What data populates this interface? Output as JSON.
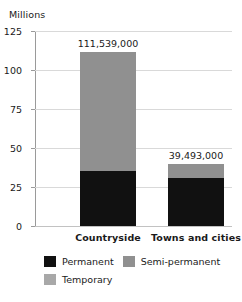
{
  "chart_data": {
    "type": "bar",
    "subtype": "stacked-bar",
    "title": "",
    "xlabel": "",
    "ylabel": "Millions",
    "ylim": [
      0,
      125
    ],
    "yticks": [
      "0",
      "25",
      "50",
      "75",
      "100",
      "125"
    ],
    "ytick_values": [
      0,
      25,
      50,
      75,
      100,
      125
    ],
    "grid": true,
    "legend_position": "bottom",
    "categories": [
      "Countryside",
      "Towns and cities"
    ],
    "series": [
      {
        "name": "Permanent",
        "color": "#111111",
        "values": [
          35.0,
          30.5
        ]
      },
      {
        "name": "Semi-permanent",
        "color": "#909090",
        "values": [
          76.5,
          9.0
        ]
      },
      {
        "name": "Temporary",
        "color": "#a8a8a8",
        "values": [
          0,
          0
        ]
      }
    ],
    "totals": [
      111539000,
      39493000
    ],
    "total_labels": [
      "111,539,000",
      "39,493,000"
    ],
    "annotations": [
      {
        "text": "111,539,000",
        "category": "Countryside"
      },
      {
        "text": "39,493,000",
        "category": "Towns and cities"
      }
    ]
  },
  "axis": {
    "unit_caption": "Millions"
  },
  "legend": {
    "items": [
      {
        "label": "Permanent",
        "color": "#111111"
      },
      {
        "label": "Semi-permanent",
        "color": "#909090"
      },
      {
        "label": "Temporary",
        "color": "#a8a8a8"
      }
    ]
  },
  "colors": {
    "permanent": "#111111",
    "semi_permanent": "#909090",
    "temporary": "#a8a8a8",
    "gridline": "#d9d9d9",
    "axis": "#9a9a9a",
    "text": "#1a1a1a",
    "background": "#ffffff"
  }
}
